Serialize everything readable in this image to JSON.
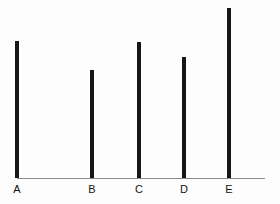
{
  "chart_data": {
    "type": "bar",
    "title": "",
    "subtitle": "",
    "xlabel": "",
    "ylabel": "",
    "categories": [
      "A",
      "B",
      "C",
      "D",
      "E"
    ],
    "values": [
      137,
      108,
      136,
      121,
      170
    ],
    "ylim": [
      0,
      175
    ],
    "grid": false,
    "legend": null,
    "legend_position": "none",
    "orientation": "vertical",
    "bar_style": "thin-line",
    "series": [
      {
        "name": "series-1",
        "values": [
          137,
          108,
          136,
          121,
          170
        ]
      }
    ],
    "annotations": []
  },
  "style": {
    "background_color": "#fdfdfd",
    "bar_color": "#161616",
    "axis_color": "#8a8a8a",
    "label_color": "#141414"
  },
  "geometry": {
    "width": 280,
    "height": 204,
    "baseline_y": 178,
    "axis_start_x": 17,
    "axis_end_x": 265,
    "bar_width": 4,
    "bar_centers": [
      17,
      92,
      139,
      184,
      229
    ],
    "label_y": 183
  },
  "axis": {
    "tick_labels": [
      "A",
      "B",
      "C",
      "D",
      "E"
    ]
  }
}
